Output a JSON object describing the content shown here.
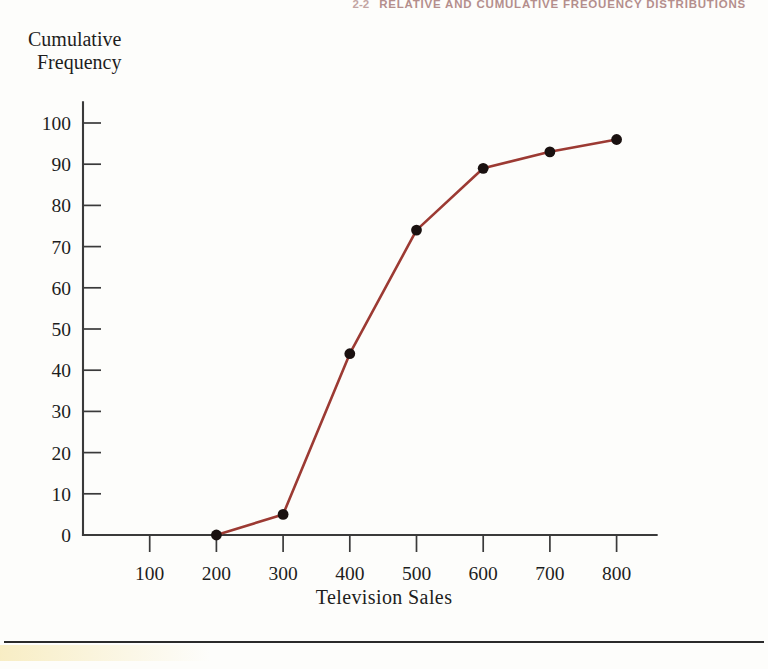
{
  "running_head": {
    "page_number": "2-2",
    "text": "RELATIVE AND CUMULATIVE FREQUENCY DISTRIBUTIONS"
  },
  "figure": {
    "y_axis_title_line1": "Cumulative",
    "y_axis_title_line2": "Frequency",
    "x_axis_title": "Television Sales"
  },
  "chart_data": {
    "type": "line",
    "title": "",
    "xlabel": "Television Sales",
    "ylabel": "Cumulative Frequency",
    "x": [
      200,
      300,
      400,
      500,
      600,
      700,
      800
    ],
    "values": [
      0,
      5,
      44,
      74,
      89,
      93,
      96
    ],
    "series": [
      {
        "name": "Cumulative Frequency",
        "values": [
          0,
          5,
          44,
          74,
          89,
          93,
          96
        ]
      }
    ],
    "xlim": [
      0,
      860
    ],
    "ylim": [
      0,
      105
    ],
    "xticks": [
      100,
      200,
      300,
      400,
      500,
      600,
      700,
      800
    ],
    "yticks": [
      0,
      10,
      20,
      30,
      40,
      50,
      60,
      70,
      80,
      90,
      100
    ],
    "xtick_labels": [
      "100",
      "200",
      "300",
      "400",
      "500",
      "600",
      "700",
      "800"
    ],
    "ytick_labels": [
      "0",
      "10",
      "20",
      "30",
      "40",
      "50",
      "60",
      "70",
      "80",
      "90",
      "100"
    ],
    "grid": false,
    "legend": "none",
    "line_color": "#9c3a33",
    "marker_color": "#1a1110",
    "axis_color": "#3a3a3a"
  }
}
